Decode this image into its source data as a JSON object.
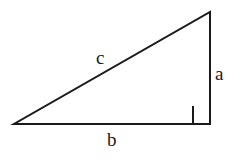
{
  "diagram": {
    "name": "right-triangle",
    "background_color": "#ffffff",
    "stroke_color": "#1a1a1a",
    "stroke_width": 2,
    "vertices": {
      "bottom_left": {
        "x": 14,
        "y": 124
      },
      "bottom_right": {
        "x": 210,
        "y": 124
      },
      "top_right": {
        "x": 210,
        "y": 12
      }
    },
    "right_angle_marker": {
      "at_vertex": "bottom_right",
      "x": 193,
      "y": 106,
      "size": 18
    },
    "labels": {
      "hypotenuse": "c",
      "vertical_leg": "a",
      "horizontal_leg": "b"
    },
    "label_positions": {
      "hypotenuse": {
        "x": 96,
        "y": 48
      },
      "vertical_leg": {
        "x": 215,
        "y": 64
      },
      "horizontal_leg": {
        "x": 107,
        "y": 130
      }
    }
  }
}
